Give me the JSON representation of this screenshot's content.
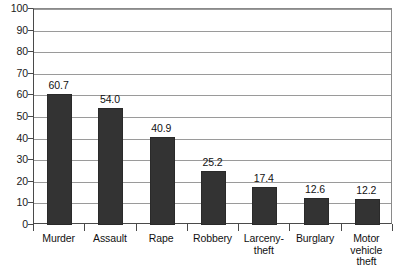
{
  "chart_data": {
    "type": "bar",
    "title": "",
    "xlabel": "",
    "ylabel": "",
    "ylim": [
      0,
      100
    ],
    "yticks": [
      0,
      10,
      20,
      30,
      40,
      50,
      60,
      70,
      80,
      90,
      100
    ],
    "ytick_labels": [
      "0",
      "10",
      "20",
      "30",
      "40",
      "50",
      "60",
      "70",
      "80",
      "90",
      "100"
    ],
    "grid": true,
    "legend": false,
    "bar_color": "#333333",
    "categories": [
      "Murder",
      "Assault",
      "Rape",
      "Robbery",
      "Larceny-theft",
      "Burglary",
      "Motor vehicle theft"
    ],
    "category_label_lines": [
      [
        "Murder"
      ],
      [
        "Assault"
      ],
      [
        "Rape"
      ],
      [
        "Robbery"
      ],
      [
        "Larceny-",
        "theft"
      ],
      [
        "Burglary"
      ],
      [
        "Motor",
        "vehicle theft"
      ]
    ],
    "values": [
      60.7,
      54.0,
      40.9,
      25.2,
      17.4,
      12.6,
      12.2
    ],
    "value_labels": [
      "60.7",
      "54.0",
      "40.9",
      "25.2",
      "17.4",
      "12.6",
      "12.2"
    ]
  }
}
